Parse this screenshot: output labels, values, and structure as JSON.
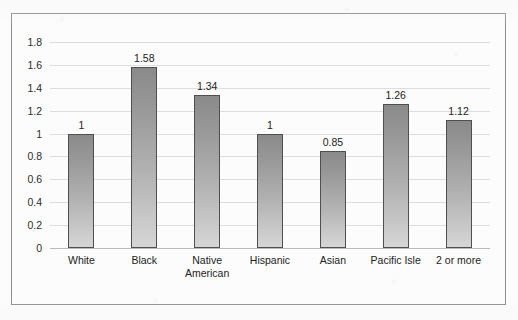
{
  "figure": {
    "background_color": "#fcfcfc",
    "frame_color": "#8e8e94",
    "gridline_color": "#dcdce2",
    "bar_fill_top": "#8a8a8a",
    "bar_fill_bottom": "#d6d6d6",
    "bar_border_color": "#4f4f4f"
  },
  "chart_data": {
    "type": "bar",
    "title": "",
    "subtitle": "",
    "xlabel": "",
    "ylabel": "",
    "categories": [
      "White",
      "Native\nAmerican",
      "Black",
      "Hispanic",
      "Asian",
      "Pacific Isle",
      "2 or more"
    ],
    "category_order": [
      "White",
      "Black",
      "Native American",
      "Hispanic",
      "Asian",
      "Pacific Isle",
      "2 or more"
    ],
    "bars": [
      {
        "label": "White",
        "label_line1": "White",
        "label_line2": "",
        "value": 1,
        "value_label": "1"
      },
      {
        "label": "Black",
        "label_line1": "Black",
        "label_line2": "",
        "value": 1.58,
        "value_label": "1.58"
      },
      {
        "label": "Native American",
        "label_line1": "Native",
        "label_line2": "American",
        "value": 1.34,
        "value_label": "1.34"
      },
      {
        "label": "Hispanic",
        "label_line1": "Hispanic",
        "label_line2": "",
        "value": 1,
        "value_label": "1"
      },
      {
        "label": "Asian",
        "label_line1": "Asian",
        "label_line2": "",
        "value": 0.85,
        "value_label": "0.85"
      },
      {
        "label": "Pacific Isle",
        "label_line1": "Pacific Isle",
        "label_line2": "",
        "value": 1.26,
        "value_label": "1.26"
      },
      {
        "label": "2 or more",
        "label_line1": "2 or more",
        "label_line2": "",
        "value": 1.12,
        "value_label": "1.12"
      }
    ],
    "values": [
      1,
      1.58,
      1.34,
      1,
      0.85,
      1.26,
      1.12
    ],
    "data_labels": [
      "1",
      "1.58",
      "1.34",
      "1",
      "0.85",
      "1.26",
      "1.12"
    ],
    "ylim": [
      0,
      1.8
    ],
    "ytick_values": [
      0,
      0.2,
      0.4,
      0.6,
      0.8,
      1,
      1.2,
      1.4,
      1.6,
      1.8
    ],
    "ytick_labels": [
      "0",
      "0.2",
      "0.4",
      "0.6",
      "0.8",
      "1",
      "1.2",
      "1.4",
      "1.6",
      "1.8"
    ],
    "grid": true,
    "grid_axis": "y",
    "legend": false,
    "legend_position": "none",
    "show_data_labels": true
  }
}
